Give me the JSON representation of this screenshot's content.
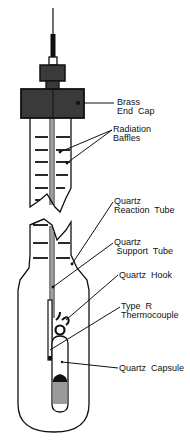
{
  "diagram": {
    "type": "apparatus-schematic",
    "labels": [
      {
        "id": "brass-end-cap",
        "line1": "Brass",
        "line2": "End  Cap"
      },
      {
        "id": "radiation-baffles",
        "line1": "Radiation",
        "line2": "Baffles"
      },
      {
        "id": "quartz-reaction-tube",
        "line1": "Quartz",
        "line2": "Reaction  Tube"
      },
      {
        "id": "quartz-support-tube",
        "line1": "Quartz",
        "line2": " Support  Tube"
      },
      {
        "id": "quartz-hook",
        "line1": "Quartz  Hook"
      },
      {
        "id": "type-r-thermocouple",
        "line1": "Type  R",
        "line2": "Thermocouple"
      },
      {
        "id": "quartz-capsule",
        "line1": "Quartz  Capsule"
      }
    ],
    "colors": {
      "ink": "#111111",
      "cap_fill": "#3a3a3a",
      "sample_fill": "#9a9a9a",
      "background": "#ffffff"
    }
  }
}
